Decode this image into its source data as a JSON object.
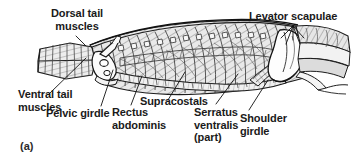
{
  "figure": {
    "panel_letter": "(a)",
    "background_color": "#ffffff",
    "ink_color": "#1a1a1a",
    "shading_color": "#8a8a8a"
  },
  "labels": {
    "dorsal_tail_muscles": "Dorsal tail\nmuscles",
    "ventral_tail_muscles": "Ventral tail\nmuscles",
    "pelvic_girdle": "Pelvic girdle",
    "rectus_abdominis": "Rectus\nabdominis",
    "supracostals": "Supracostals",
    "serratus_ventralis": "Serratus\nventralis\n(part)",
    "shoulder_girdle": "Shoulder\ngirdle",
    "levator_scapulae": "Levator scapulae"
  }
}
